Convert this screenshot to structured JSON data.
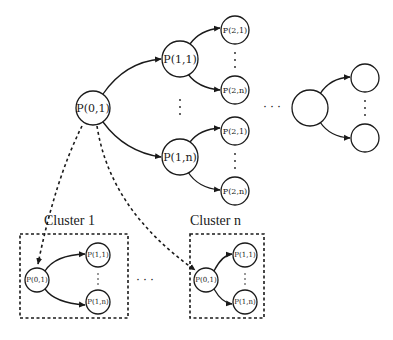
{
  "diagram": {
    "type": "hierarchical-tree-with-clusters",
    "colors": {
      "stroke": "#1a1a1a",
      "background": "#ffffff"
    },
    "top_tree": {
      "root": {
        "label": "P(0,1)"
      },
      "level1": [
        {
          "label": "P(1,1)",
          "children": [
            {
              "label": "P(2,1)"
            },
            {
              "label": "P(2,n)"
            }
          ]
        },
        {
          "label": "P(1,n)",
          "children": [
            {
              "label": "P(2,1)"
            },
            {
              "label": "P(2,n)"
            }
          ]
        }
      ],
      "continuation_dots": "· · ·",
      "generic_subtree": {
        "root_label": "",
        "child_labels": [
          "",
          ""
        ]
      }
    },
    "clusters": [
      {
        "title": "Cluster 1",
        "root": "P(0,1)",
        "children": [
          "P(1,1)",
          "P(1,n)"
        ]
      },
      {
        "title": "Cluster n",
        "root": "P(0,1)",
        "children": [
          "P(1,1)",
          "P(1,n)"
        ]
      }
    ],
    "between_clusters_dots": "· · ·"
  }
}
